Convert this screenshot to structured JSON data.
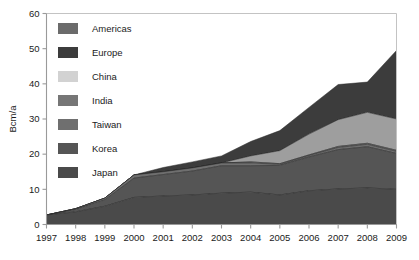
{
  "chart_data": {
    "type": "area",
    "stacked": true,
    "title": "",
    "xlabel": "",
    "ylabel": "Bcm/a",
    "x": [
      1997,
      1998,
      1999,
      2000,
      2001,
      2002,
      2003,
      2004,
      2005,
      2006,
      2007,
      2008,
      2009
    ],
    "xtick_labels": [
      "1997",
      "1998",
      "1999",
      "2000",
      "2001",
      "2002",
      "2003",
      "2004",
      "2005",
      "2006",
      "2007",
      "2008",
      "2009"
    ],
    "ytick_labels": [
      "0",
      "10",
      "20",
      "30",
      "40",
      "50",
      "60"
    ],
    "yticks": [
      0,
      10,
      20,
      30,
      40,
      50,
      60
    ],
    "ylim": [
      0,
      60
    ],
    "xlim": [
      1997,
      2009
    ],
    "grid": false,
    "legend_position": "upper-left inside plot",
    "stack_order_bottom_to_top": [
      "Japan",
      "Korea",
      "Taiwan",
      "India",
      "China",
      "Europe",
      "Americas"
    ],
    "series": [
      {
        "name": "Japan",
        "color": "#4a4a4a",
        "values": [
          2.7,
          3.6,
          5.2,
          7.7,
          8.1,
          8.4,
          8.9,
          9.2,
          8.4,
          9.6,
          10.1,
          10.4,
          10.0
        ]
      },
      {
        "name": "Korea",
        "color": "#555555",
        "values": [
          0.0,
          0.7,
          1.8,
          5.5,
          6.1,
          6.8,
          7.8,
          7.5,
          8.4,
          9.6,
          11.2,
          11.7,
          10.2
        ]
      },
      {
        "name": "Taiwan",
        "color": "#6f6f6f",
        "values": [
          0.0,
          0.2,
          0.5,
          0.9,
          0.8,
          0.9,
          0.8,
          0.8,
          0.3,
          0.4,
          0.6,
          0.7,
          0.6
        ]
      },
      {
        "name": "India",
        "color": "#767676",
        "values": [
          0.0,
          0.0,
          0.0,
          0.0,
          0.0,
          0.0,
          0.0,
          0.3,
          0.2,
          0.2,
          0.3,
          0.3,
          0.3
        ]
      },
      {
        "name": "China",
        "color": "#9e9e9e",
        "values": [
          0.0,
          0.0,
          0.0,
          0.0,
          0.0,
          0.0,
          0.0,
          1.7,
          3.7,
          5.9,
          7.6,
          8.8,
          8.9
        ]
      },
      {
        "name": "Europe",
        "color": "#3c3c3c",
        "values": [
          0.0,
          0.0,
          0.0,
          0.0,
          1.2,
          1.7,
          2.0,
          4.1,
          5.7,
          7.6,
          10.0,
          8.6,
          19.5
        ]
      },
      {
        "name": "Americas",
        "color": "#6b6b6b",
        "values": [
          0.0,
          0.0,
          0.0,
          0.0,
          0.0,
          0.0,
          0.0,
          0.0,
          0.0,
          0.0,
          0.0,
          0.0,
          0.0
        ]
      }
    ],
    "stack_top_totals": [
      2.7,
      4.5,
      7.5,
      14.1,
      16.2,
      17.8,
      19.5,
      23.6,
      26.7,
      33.3,
      39.8,
      40.5,
      49.5
    ]
  },
  "legend": {
    "items": [
      {
        "label": "Americas",
        "color": "#6b6b6b"
      },
      {
        "label": "Europe",
        "color": "#3c3c3c"
      },
      {
        "label": "China",
        "color": "#d2d2d2"
      },
      {
        "label": "India",
        "color": "#767676"
      },
      {
        "label": "Taiwan",
        "color": "#6f6f6f"
      },
      {
        "label": "Korea",
        "color": "#555555"
      },
      {
        "label": "Japan",
        "color": "#4a4a4a"
      }
    ]
  },
  "axes": {
    "y_title": "Bcm/a",
    "axis_color": "#9a9a9a",
    "text_color": "#1b1b1b"
  }
}
